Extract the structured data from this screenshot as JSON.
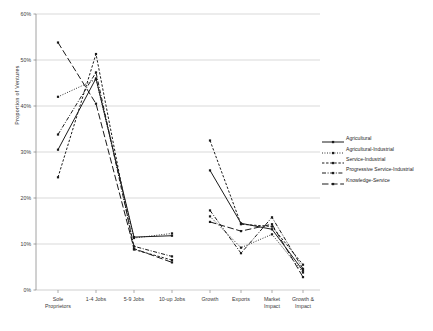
{
  "chart_data": {
    "type": "line",
    "title": "",
    "xlabel": "",
    "ylabel": "Proportion of Ventures",
    "ylim": [
      0,
      60
    ],
    "ytick_labels": [
      "0%",
      "10%",
      "20%",
      "30%",
      "40%",
      "50%",
      "60%"
    ],
    "ytick_values": [
      0,
      10,
      20,
      30,
      40,
      50,
      60
    ],
    "grid": true,
    "legend_position": "right",
    "categories": [
      "Sole Proprietors",
      "1-4 Jobs",
      "5-9 Jobs",
      "10-up Jobs",
      "Growth",
      "Exports",
      "Market Impact",
      "Growth & Impact"
    ],
    "category_lines": [
      [
        "Sole",
        "Proprietors"
      ],
      [
        "1-4 Jobs"
      ],
      [
        "5-9 Jobs"
      ],
      [
        "10-up Jobs"
      ],
      [
        "Growth"
      ],
      [
        "Exports"
      ],
      [
        "Market",
        "Impact"
      ],
      [
        "Growth &",
        "Impact"
      ]
    ],
    "series": [
      {
        "name": "Agricultural",
        "style": "solid",
        "color": "#1a1a1a",
        "values": [
          30.5,
          46.0,
          11.5,
          11.8,
          26.0,
          14.5,
          13.2,
          4.2
        ]
      },
      {
        "name": "Agricultural-Industrial",
        "style": "dotted",
        "color": "#1a1a1a",
        "values": [
          42.0,
          45.8,
          11.3,
          12.3,
          16.0,
          9.2,
          12.1,
          3.8
        ]
      },
      {
        "name": "Service-Industrial",
        "style": "dashed-fine",
        "color": "#1a1a1a",
        "values": [
          24.5,
          51.3,
          8.8,
          6.5,
          32.5,
          14.3,
          13.8,
          5.5
        ]
      },
      {
        "name": "Progressive Service-Industrial",
        "style": "dash-dot",
        "color": "#1a1a1a",
        "values": [
          33.8,
          47.3,
          9.5,
          7.3,
          17.3,
          8.0,
          15.8,
          4.6
        ]
      },
      {
        "name": "Knowledge-Service",
        "style": "long-dash",
        "color": "#1a1a1a",
        "values": [
          53.8,
          40.5,
          9.0,
          6.0,
          14.8,
          12.8,
          14.3,
          2.8
        ]
      }
    ]
  },
  "legend": {
    "items": [
      "Agricultural",
      "Agricultural-Industrial",
      "Service-Industrial",
      "Progressive Service-Industrial",
      "Knowledge-Service"
    ]
  }
}
